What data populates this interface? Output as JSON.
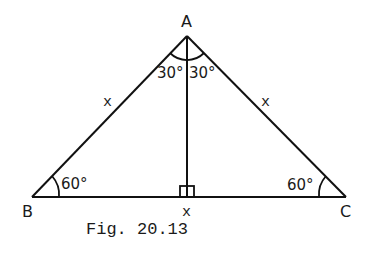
{
  "figure": {
    "caption": "Fig. 20.13",
    "vertices": {
      "A": "A",
      "B": "B",
      "C": "C"
    },
    "angles": {
      "A_left": "30°",
      "A_right": "30°",
      "B": "60°",
      "C": "60°"
    },
    "sides": {
      "AB": "x",
      "AC": "x",
      "BC_foot": "x"
    },
    "right_angle_marker": "at foot of altitude from A on BC",
    "stroke_color": "#111111",
    "background": "#ffffff"
  }
}
